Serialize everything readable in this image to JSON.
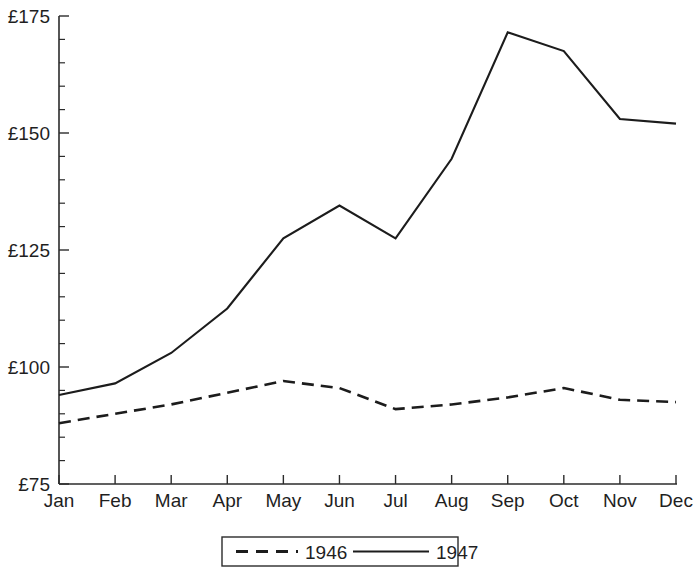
{
  "chart_data": {
    "type": "line",
    "title": "",
    "subtitle": "",
    "xlabel": "",
    "ylabel": "",
    "categories": [
      "Jan",
      "Feb",
      "Mar",
      "Apr",
      "May",
      "Jun",
      "Jul",
      "Aug",
      "Sep",
      "Oct",
      "Nov",
      "Dec"
    ],
    "series": [
      {
        "name": "1946",
        "style": "dashed",
        "color": "#1c1c1c",
        "values": [
          88,
          90,
          92,
          94.5,
          97,
          95.5,
          91,
          92,
          93.5,
          95.5,
          93,
          92.5
        ]
      },
      {
        "name": "1947",
        "style": "solid",
        "color": "#1c1c1c",
        "values": [
          94,
          96.5,
          103,
          112.5,
          127.5,
          134.5,
          127.5,
          144.5,
          171.5,
          167.5,
          153,
          152
        ]
      }
    ],
    "ylim": [
      75,
      175
    ],
    "ytick_major_step": 25,
    "ytick_minor_step": 5,
    "ytick_labels": [
      "£175",
      "£150",
      "£125",
      "£100",
      "£75"
    ],
    "ytick_values": [
      175,
      150,
      125,
      100,
      75
    ],
    "grid": false,
    "legend_position": "bottom-center",
    "legend_entries": [
      {
        "label": "1946",
        "style": "dashed"
      },
      {
        "label": "1947",
        "style": "solid"
      }
    ]
  }
}
